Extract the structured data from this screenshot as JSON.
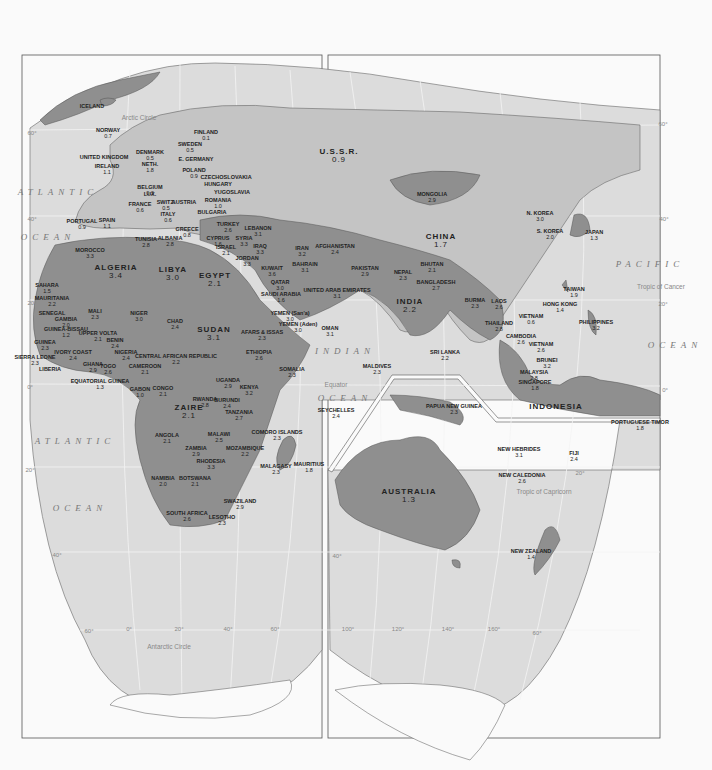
{
  "map": {
    "type": "world map (Eastern Hemisphere)",
    "countries": [
      {
        "name": "ICELAND",
        "value": "",
        "x": 92,
        "y": 104
      },
      {
        "name": "NORWAY",
        "value": "0.7",
        "x": 108,
        "y": 128
      },
      {
        "name": "FINLAND",
        "value": "0.1",
        "x": 206,
        "y": 130
      },
      {
        "name": "SWEDEN",
        "value": "0.5",
        "x": 190,
        "y": 142
      },
      {
        "name": "DENMARK",
        "value": "0.5",
        "x": 150,
        "y": 150
      },
      {
        "name": "UNITED KINGDOM",
        "value": "",
        "x": 104,
        "y": 155
      },
      {
        "name": "E. GERMANY",
        "value": "",
        "x": 196,
        "y": 157
      },
      {
        "name": "NETH.",
        "value": "1.8",
        "x": 150,
        "y": 162
      },
      {
        "name": "IRELAND",
        "value": "1.1",
        "x": 107,
        "y": 164
      },
      {
        "name": "POLAND",
        "value": "0.9",
        "x": 194,
        "y": 168
      },
      {
        "name": "CZECHOSLOVAKIA",
        "value": "",
        "x": 226,
        "y": 175
      },
      {
        "name": "BELGIUM",
        "value": "0.3",
        "x": 150,
        "y": 185
      },
      {
        "name": "HUNGARY",
        "value": "",
        "x": 218,
        "y": 182
      },
      {
        "name": "YUGOSLAVIA",
        "value": "",
        "x": 232,
        "y": 190
      },
      {
        "name": "LUX.",
        "value": "",
        "x": 150,
        "y": 192
      },
      {
        "name": "FRANCE",
        "value": "0.6",
        "x": 140,
        "y": 202
      },
      {
        "name": "SWITZ.",
        "value": "0.5",
        "x": 166,
        "y": 200
      },
      {
        "name": "AUSTRIA",
        "value": "",
        "x": 184,
        "y": 200
      },
      {
        "name": "ROMANIA",
        "value": "1.0",
        "x": 218,
        "y": 198
      },
      {
        "name": "BULGARIA",
        "value": "",
        "x": 212,
        "y": 210
      },
      {
        "name": "ITALY",
        "value": "0.6",
        "x": 168,
        "y": 212
      },
      {
        "name": "SPAIN",
        "value": "1.1",
        "x": 107,
        "y": 218
      },
      {
        "name": "PORTUGAL",
        "value": "0.9",
        "x": 82,
        "y": 219
      },
      {
        "name": "GREECE",
        "value": "0.8",
        "x": 187,
        "y": 227
      },
      {
        "name": "TURKEY",
        "value": "2.6",
        "x": 228,
        "y": 222
      },
      {
        "name": "LEBANON",
        "value": "3.1",
        "x": 258,
        "y": 226
      },
      {
        "name": "ALBANIA",
        "value": "2.8",
        "x": 170,
        "y": 236
      },
      {
        "name": "TUNISIA",
        "value": "2.8",
        "x": 146,
        "y": 237
      },
      {
        "name": "CYPRUS",
        "value": "1.6",
        "x": 218,
        "y": 236
      },
      {
        "name": "SYRIA",
        "value": "3.3",
        "x": 244,
        "y": 236
      },
      {
        "name": "ISRAEL",
        "value": "2.1",
        "x": 226,
        "y": 245
      },
      {
        "name": "IRAQ",
        "value": "3.3",
        "x": 260,
        "y": 244
      },
      {
        "name": "IRAN",
        "value": "3.2",
        "x": 302,
        "y": 246
      },
      {
        "name": "AFGHANISTAN",
        "value": "2.4",
        "x": 335,
        "y": 244
      },
      {
        "name": "JORDAN",
        "value": "3.3",
        "x": 247,
        "y": 256
      },
      {
        "name": "MOROCCO",
        "value": "3.3",
        "x": 90,
        "y": 248
      },
      {
        "name": "ALGERIA",
        "value": "3.4",
        "x": 116,
        "y": 264
      },
      {
        "name": "LIBYA",
        "value": "3.0",
        "x": 173,
        "y": 266
      },
      {
        "name": "EGYPT",
        "value": "2.1",
        "x": 215,
        "y": 272
      },
      {
        "name": "KUWAIT",
        "value": "3.6",
        "x": 272,
        "y": 266
      },
      {
        "name": "BAHRAIN",
        "value": "3.1",
        "x": 305,
        "y": 262
      },
      {
        "name": "PAKISTAN",
        "value": "2.9",
        "x": 365,
        "y": 266
      },
      {
        "name": "QATAR",
        "value": "3.0",
        "x": 280,
        "y": 280
      },
      {
        "name": "SAUDI ARABIA",
        "value": "1.6",
        "x": 281,
        "y": 292
      },
      {
        "name": "UNITED ARAB EMIRATES",
        "value": "3.1",
        "x": 337,
        "y": 288
      },
      {
        "name": "NEPAL",
        "value": "2.3",
        "x": 403,
        "y": 270
      },
      {
        "name": "BHUTAN",
        "value": "2.1",
        "x": 432,
        "y": 262
      },
      {
        "name": "BANGLADESH",
        "value": "2.7",
        "x": 436,
        "y": 280
      },
      {
        "name": "INDIA",
        "value": "2.2",
        "x": 410,
        "y": 298
      },
      {
        "name": "SAHARA",
        "value": "1.5",
        "x": 47,
        "y": 283
      },
      {
        "name": "MAURITANIA",
        "value": "2.2",
        "x": 52,
        "y": 296
      },
      {
        "name": "MALI",
        "value": "2.3",
        "x": 95,
        "y": 309
      },
      {
        "name": "NIGER",
        "value": "3.0",
        "x": 139,
        "y": 311
      },
      {
        "name": "CHAD",
        "value": "2.4",
        "x": 175,
        "y": 319
      },
      {
        "name": "SUDAN",
        "value": "3.1",
        "x": 214,
        "y": 326
      },
      {
        "name": "YEMEN (San'a)",
        "value": "3.0",
        "x": 290,
        "y": 311
      },
      {
        "name": "YEMEN (Aden)",
        "value": "3.0",
        "x": 298,
        "y": 322
      },
      {
        "name": "OMAN",
        "value": "3.1",
        "x": 330,
        "y": 326
      },
      {
        "name": "SENEGAL",
        "value": "",
        "x": 52,
        "y": 311
      },
      {
        "name": "GAMBIA",
        "value": "2.0",
        "x": 66,
        "y": 317
      },
      {
        "name": "GUINEA-BISSAU",
        "value": "1.2",
        "x": 66,
        "y": 327
      },
      {
        "name": "UPPER VOLTA",
        "value": "2.1",
        "x": 98,
        "y": 331
      },
      {
        "name": "BENIN",
        "value": "2.4",
        "x": 115,
        "y": 338
      },
      {
        "name": "AFARS & ISSAS",
        "value": "2.3",
        "x": 262,
        "y": 330
      },
      {
        "name": "GUINEA",
        "value": "2.3",
        "x": 45,
        "y": 340
      },
      {
        "name": "NIGERIA",
        "value": "2.4",
        "x": 126,
        "y": 350
      },
      {
        "name": "IVORY COAST",
        "value": "2.4",
        "x": 73,
        "y": 350
      },
      {
        "name": "ETHIOPIA",
        "value": "2.6",
        "x": 259,
        "y": 350
      },
      {
        "name": "SIERRA LEONE",
        "value": "2.3",
        "x": 35,
        "y": 355
      },
      {
        "name": "CENTRAL AFRICAN REPUBLIC",
        "value": "2.2",
        "x": 176,
        "y": 354
      },
      {
        "name": "GHANA",
        "value": "2.9",
        "x": 93,
        "y": 362
      },
      {
        "name": "TOGO",
        "value": "2.6",
        "x": 108,
        "y": 364
      },
      {
        "name": "CAMEROON",
        "value": "2.1",
        "x": 145,
        "y": 364
      },
      {
        "name": "LIBERIA",
        "value": "",
        "x": 50,
        "y": 367
      },
      {
        "name": "SOMALIA",
        "value": "2.3",
        "x": 292,
        "y": 367
      },
      {
        "name": "EQUATORIAL GUINEA",
        "value": "1.3",
        "x": 100,
        "y": 379
      },
      {
        "name": "GABON",
        "value": "1.0",
        "x": 140,
        "y": 387
      },
      {
        "name": "CONGO",
        "value": "2.1",
        "x": 163,
        "y": 386
      },
      {
        "name": "UGANDA",
        "value": "2.9",
        "x": 228,
        "y": 378
      },
      {
        "name": "KENYA",
        "value": "3.2",
        "x": 249,
        "y": 385
      },
      {
        "name": "RWANDA",
        "value": "2.8",
        "x": 205,
        "y": 397
      },
      {
        "name": "ZAIRE",
        "value": "2.1",
        "x": 189,
        "y": 404
      },
      {
        "name": "BURUNDI",
        "value": "2.4",
        "x": 227,
        "y": 398
      },
      {
        "name": "TANZANIA",
        "value": "2.7",
        "x": 239,
        "y": 410
      },
      {
        "name": "ANGOLA",
        "value": "2.1",
        "x": 167,
        "y": 433
      },
      {
        "name": "MALAWI",
        "value": "2.5",
        "x": 219,
        "y": 432
      },
      {
        "name": "ZAMBIA",
        "value": "2.9",
        "x": 196,
        "y": 446
      },
      {
        "name": "MOZAMBIQUE",
        "value": "2.2",
        "x": 245,
        "y": 446
      },
      {
        "name": "RHODESIA",
        "value": "3.3",
        "x": 211,
        "y": 459
      },
      {
        "name": "NAMIBIA",
        "value": "2.0",
        "x": 163,
        "y": 476
      },
      {
        "name": "BOTSWANA",
        "value": "2.1",
        "x": 195,
        "y": 476
      },
      {
        "name": "SWAZILAND",
        "value": "2.9",
        "x": 240,
        "y": 499
      },
      {
        "name": "SOUTH AFRICA",
        "value": "2.6",
        "x": 187,
        "y": 511
      },
      {
        "name": "LESOTHO",
        "value": "2.3",
        "x": 222,
        "y": 515
      },
      {
        "name": "COMORO ISLANDS",
        "value": "2.3",
        "x": 277,
        "y": 430
      },
      {
        "name": "MALAGASY",
        "value": "2.3",
        "x": 276,
        "y": 464
      },
      {
        "name": "MAURITIUS",
        "value": "1.8",
        "x": 309,
        "y": 462
      },
      {
        "name": "SEYCHELLES",
        "value": "2.4",
        "x": 336,
        "y": 408
      },
      {
        "name": "MALDIVES",
        "value": "2.3",
        "x": 377,
        "y": 364
      },
      {
        "name": "SRI LANKA",
        "value": "2.2",
        "x": 445,
        "y": 350
      },
      {
        "name": "U.S.S.R.",
        "value": "0.9",
        "x": 339,
        "y": 148
      },
      {
        "name": "MONGOLIA",
        "value": "2.9",
        "x": 432,
        "y": 192
      },
      {
        "name": "CHINA",
        "value": "1.7",
        "x": 441,
        "y": 233
      },
      {
        "name": "N. KOREA",
        "value": "3.0",
        "x": 540,
        "y": 211
      },
      {
        "name": "S. KOREA",
        "value": "2.0",
        "x": 550,
        "y": 229
      },
      {
        "name": "JAPAN",
        "value": "1.3",
        "x": 594,
        "y": 230
      },
      {
        "name": "TAIWAN",
        "value": "1.9",
        "x": 574,
        "y": 287
      },
      {
        "name": "HONG KONG",
        "value": "1.4",
        "x": 560,
        "y": 302
      },
      {
        "name": "BURMA",
        "value": "2.3",
        "x": 475,
        "y": 298
      },
      {
        "name": "LAOS",
        "value": "2.6",
        "x": 499,
        "y": 299
      },
      {
        "name": "VIETNAM",
        "value": "0.6",
        "x": 531,
        "y": 314
      },
      {
        "name": "THAILAND",
        "value": "2.8",
        "x": 499,
        "y": 321
      },
      {
        "name": "PHILIPPINES",
        "value": "3.2",
        "x": 596,
        "y": 320
      },
      {
        "name": "CAMBODIA",
        "value": "2.6",
        "x": 521,
        "y": 334
      },
      {
        "name": "VIETNAM",
        "value": "2.6",
        "x": 541,
        "y": 342
      },
      {
        "name": "BRUNEI",
        "value": "3.2",
        "x": 547,
        "y": 358
      },
      {
        "name": "MALAYSIA",
        "value": "2.8",
        "x": 534,
        "y": 370
      },
      {
        "name": "SINGAPORE",
        "value": "1.8",
        "x": 535,
        "y": 380
      },
      {
        "name": "INDONESIA",
        "value": "",
        "x": 556,
        "y": 403
      },
      {
        "name": "PORTUGUESE TIMOR",
        "value": "1.8",
        "x": 640,
        "y": 420
      },
      {
        "name": "PAPUA NEW GUINEA",
        "value": "2.3",
        "x": 454,
        "y": 404
      },
      {
        "name": "NEW HEBRIDES",
        "value": "3.1",
        "x": 519,
        "y": 447
      },
      {
        "name": "FIJI",
        "value": "2.4",
        "x": 574,
        "y": 451
      },
      {
        "name": "NEW CALEDONIA",
        "value": "2.6",
        "x": 522,
        "y": 473
      },
      {
        "name": "AUSTRALIA",
        "value": "1.3",
        "x": 409,
        "y": 488
      },
      {
        "name": "NEW ZEALAND",
        "value": "1.4",
        "x": 531,
        "y": 549
      }
    ],
    "oceans": [
      {
        "name": "ATLANTIC",
        "x": 58,
        "y": 187
      },
      {
        "name": "OCEAN",
        "x": 48,
        "y": 232
      },
      {
        "name": "INDIAN",
        "x": 345,
        "y": 346
      },
      {
        "name": "OCEAN",
        "x": 345,
        "y": 393
      },
      {
        "name": "PACIFIC",
        "x": 650,
        "y": 259
      },
      {
        "name": "OCEAN",
        "x": 675,
        "y": 340
      },
      {
        "name": "ATLANTIC",
        "x": 75,
        "y": 436
      },
      {
        "name": "OCEAN",
        "x": 80,
        "y": 503
      }
    ],
    "reference_lines": [
      {
        "name": "Arctic Circle",
        "x": 139,
        "y": 114
      },
      {
        "name": "Tropic of Cancer",
        "x": 661,
        "y": 283
      },
      {
        "name": "Equator",
        "x": 336,
        "y": 381
      },
      {
        "name": "Tropic of Capricorn",
        "x": 544,
        "y": 488
      },
      {
        "name": "Antarctic Circle",
        "x": 169,
        "y": 643
      }
    ],
    "graticule_labels": [
      {
        "text": "60°",
        "x": 32,
        "y": 130
      },
      {
        "text": "40°",
        "x": 32,
        "y": 216
      },
      {
        "text": "20°",
        "x": 32,
        "y": 300
      },
      {
        "text": "0°",
        "x": 30,
        "y": 384
      },
      {
        "text": "20°",
        "x": 30,
        "y": 467
      },
      {
        "text": "40°",
        "x": 57,
        "y": 552
      },
      {
        "text": "60°",
        "x": 663,
        "y": 121
      },
      {
        "text": "40°",
        "x": 664,
        "y": 216
      },
      {
        "text": "20°",
        "x": 663,
        "y": 301
      },
      {
        "text": "0°",
        "x": 665,
        "y": 387
      },
      {
        "text": "20°",
        "x": 580,
        "y": 470
      },
      {
        "text": "40°",
        "x": 337,
        "y": 553
      },
      {
        "text": "60°",
        "x": 89,
        "y": 628
      },
      {
        "text": "0°",
        "x": 129,
        "y": 626
      },
      {
        "text": "20°",
        "x": 179,
        "y": 626
      },
      {
        "text": "40°",
        "x": 228,
        "y": 626
      },
      {
        "text": "60°",
        "x": 275,
        "y": 626
      },
      {
        "text": "100°",
        "x": 348,
        "y": 626
      },
      {
        "text": "120°",
        "x": 398,
        "y": 626
      },
      {
        "text": "140°",
        "x": 448,
        "y": 626
      },
      {
        "text": "160°",
        "x": 494,
        "y": 626
      },
      {
        "text": "60°",
        "x": 537,
        "y": 630
      }
    ]
  },
  "colors": {
    "page": "#fafafa",
    "ocean": "#dcdcdc",
    "land_light": "#c4c4c4",
    "land_dark": "#8f8f8f",
    "frame": "#555555",
    "grid": "#f2f2f2"
  }
}
